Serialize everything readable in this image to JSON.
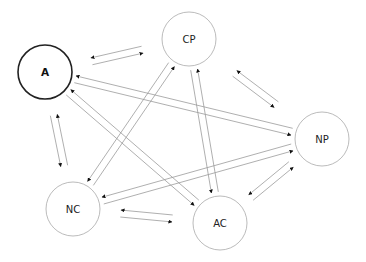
{
  "diagram": {
    "type": "directed-graph",
    "nodes": [
      {
        "id": "A",
        "label": "A",
        "cx": 45,
        "cy": 72,
        "r": 27,
        "emphasized": true
      },
      {
        "id": "CP",
        "label": "CP",
        "cx": 189,
        "cy": 39,
        "r": 27,
        "emphasized": false
      },
      {
        "id": "NP",
        "label": "NP",
        "cx": 322,
        "cy": 139,
        "r": 27,
        "emphasized": false
      },
      {
        "id": "NC",
        "label": "NC",
        "cx": 73,
        "cy": 209,
        "r": 27,
        "emphasized": false
      },
      {
        "id": "AC",
        "label": "AC",
        "cx": 220,
        "cy": 223,
        "r": 27,
        "emphasized": false
      }
    ],
    "edges": [
      {
        "from": "A",
        "to": "CP",
        "style": "floating-pair",
        "bidirectional": true
      },
      {
        "from": "CP",
        "to": "NP",
        "style": "floating-pair",
        "bidirectional": true
      },
      {
        "from": "A",
        "to": "NC",
        "style": "floating-pair",
        "bidirectional": true
      },
      {
        "from": "NC",
        "to": "AC",
        "style": "floating-pair",
        "bidirectional": true
      },
      {
        "from": "NP",
        "to": "AC",
        "style": "floating-pair",
        "bidirectional": true
      },
      {
        "from": "A",
        "to": "NP",
        "style": "connected-pair",
        "bidirectional": true
      },
      {
        "from": "A",
        "to": "AC",
        "style": "connected-pair",
        "bidirectional": true
      },
      {
        "from": "CP",
        "to": "NC",
        "style": "connected-pair",
        "bidirectional": true
      },
      {
        "from": "CP",
        "to": "AC",
        "style": "connected-pair",
        "bidirectional": true
      },
      {
        "from": "NC",
        "to": "NP",
        "style": "connected-pair",
        "bidirectional": true
      }
    ],
    "colors": {
      "emphasized_border": "#222222",
      "node_border": "#aaaaaa",
      "edge_line": "#9a9a9a",
      "arrowhead": "#111111"
    }
  }
}
